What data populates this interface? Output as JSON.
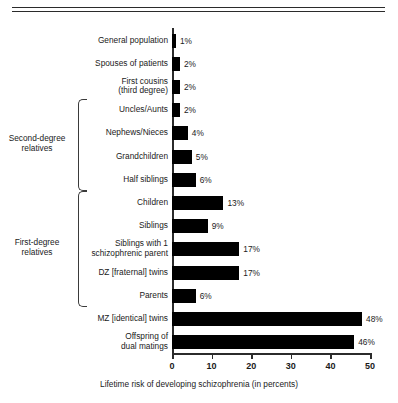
{
  "figure": {
    "caption": "Lifetime risk of developing schizophrenia (in percents)"
  },
  "groups": [
    {
      "id": "second-degree",
      "label": "Second-degree\nrelatives"
    },
    {
      "id": "first-degree",
      "label": "First-degree\nrelatives"
    }
  ],
  "axis": {
    "ticks": [
      "0",
      "10",
      "20",
      "30",
      "40",
      "50"
    ]
  },
  "rows": [
    {
      "label": "General population",
      "value": 1,
      "value_label": "1%"
    },
    {
      "label": "Spouses of patients",
      "value": 2,
      "value_label": "2%"
    },
    {
      "label": "First cousins\n(third degree)",
      "value": 2,
      "value_label": "2%"
    },
    {
      "label": "Uncles/Aunts",
      "value": 2,
      "value_label": "2%"
    },
    {
      "label": "Nephews/Nieces",
      "value": 4,
      "value_label": "4%"
    },
    {
      "label": "Grandchildren",
      "value": 5,
      "value_label": "5%"
    },
    {
      "label": "Half siblings",
      "value": 6,
      "value_label": "6%"
    },
    {
      "label": "Children",
      "value": 13,
      "value_label": "13%"
    },
    {
      "label": "Siblings",
      "value": 9,
      "value_label": "9%"
    },
    {
      "label": "Siblings with 1\nschizophrenic parent",
      "value": 17,
      "value_label": "17%"
    },
    {
      "label": "DZ [fraternal] twins",
      "value": 17,
      "value_label": "17%"
    },
    {
      "label": "Parents",
      "value": 6,
      "value_label": "6%"
    },
    {
      "label": "MZ [identical] twins",
      "value": 48,
      "value_label": "48%"
    },
    {
      "label": "Offspring of\ndual matings",
      "value": 46,
      "value_label": "46%"
    }
  ],
  "chart_data": {
    "type": "bar",
    "orientation": "horizontal",
    "title": "",
    "subtitle": "",
    "xlabel": "Lifetime risk of developing schizophrenia (in percents)",
    "ylabel": "",
    "xlim": [
      0,
      50
    ],
    "xticks": [
      0,
      10,
      20,
      30,
      40,
      50
    ],
    "grid": false,
    "legend": null,
    "bar_color": "#000000",
    "categories": [
      "General population",
      "Spouses of patients",
      "First cousins (third degree)",
      "Uncles/Aunts",
      "Nephews/Nieces",
      "Grandchildren",
      "Half siblings",
      "Children",
      "Siblings",
      "Siblings with 1 schizophrenic parent",
      "DZ [fraternal] twins",
      "Parents",
      "MZ [identical] twins",
      "Offspring of dual matings"
    ],
    "values": [
      1,
      2,
      2,
      2,
      4,
      5,
      6,
      13,
      9,
      17,
      17,
      6,
      48,
      46
    ],
    "data_labels": [
      "1%",
      "2%",
      "2%",
      "2%",
      "4%",
      "5%",
      "6%",
      "13%",
      "9%",
      "17%",
      "17%",
      "6%",
      "48%",
      "46%"
    ],
    "annotations": [
      {
        "text": "Second-degree relatives",
        "covers": [
          "Uncles/Aunts",
          "Nephews/Nieces",
          "Grandchildren",
          "Half siblings"
        ]
      },
      {
        "text": "First-degree relatives",
        "covers": [
          "Children",
          "Siblings",
          "Siblings with 1 schizophrenic parent",
          "DZ [fraternal] twins",
          "Parents"
        ]
      }
    ]
  }
}
